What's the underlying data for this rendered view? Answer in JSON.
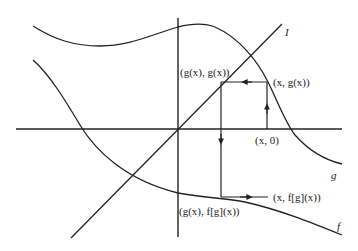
{
  "diagram": {
    "title": "",
    "curves": {
      "identity": {
        "name": "I",
        "color": "#222222"
      },
      "g": {
        "name": "g",
        "color": "#222222"
      },
      "f": {
        "name": "f",
        "color": "#222222"
      }
    },
    "points": {
      "x0": "(x, 0)",
      "xgx": "(x, g(x))",
      "gxgx": "(g(x), g(x))",
      "gxfgx": "(g(x), f[g](x))",
      "xfgx": "(x, f[g](x))"
    },
    "labels": {
      "I": "I",
      "g": "g",
      "f": "f",
      "x0": "(x, 0)",
      "xgx": "(x, g(x))",
      "gxgx": "(g(x), g(x))",
      "gxfgx": "(g(x), f[g](x))",
      "xfgx": "(x, f[g](x))"
    },
    "colors": {
      "stroke": "#222222",
      "background": "#ffffff"
    }
  }
}
